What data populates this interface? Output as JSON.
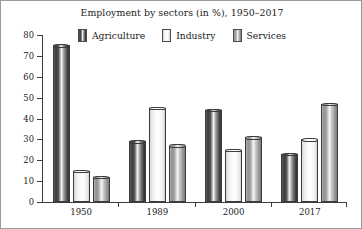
{
  "chart_data": {
    "type": "bar",
    "title": "Employment by sectors (in %), 1950–2017",
    "xlabel": "",
    "ylabel": "",
    "ylim": [
      0,
      80
    ],
    "yticks": [
      0,
      10,
      20,
      30,
      40,
      50,
      60,
      70,
      80
    ],
    "grid": false,
    "legend_position": "top-center",
    "categories": [
      "1950",
      "1989",
      "2000",
      "2017"
    ],
    "series": [
      {
        "name": "Agriculture",
        "color": "#4a4a4a",
        "values": [
          75,
          29,
          44,
          23
        ]
      },
      {
        "name": "Industry",
        "color": "#f2f2f2",
        "values": [
          15,
          45,
          25,
          30
        ]
      },
      {
        "name": "Services",
        "color": "#a8a8a8",
        "values": [
          12,
          27,
          31,
          47
        ]
      }
    ]
  },
  "legend": {
    "items": [
      {
        "label": "Agriculture"
      },
      {
        "label": "Industry"
      },
      {
        "label": "Services"
      }
    ]
  }
}
